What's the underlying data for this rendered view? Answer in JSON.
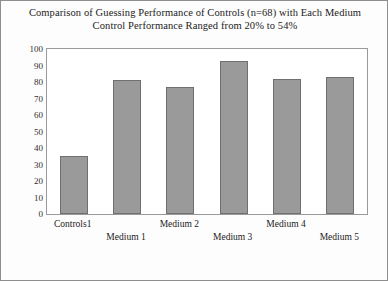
{
  "title": {
    "line1": "Comparison of Guessing Performance of Controls (n=68) with Each Medium",
    "line2": "Control Performance Ranged from 20% to 54%"
  },
  "axes": {
    "ylabel": "Percent Yes",
    "yticks": [
      "0",
      "10",
      "20",
      "30",
      "40",
      "50",
      "60",
      "70",
      "80",
      "90",
      "100"
    ],
    "xlabels": [
      "Controls1",
      "Medium 1",
      "Medium 2",
      "Medium 3",
      "Medium 4",
      "Medium 5"
    ]
  },
  "colors": {
    "bar_fill": "#9a9a9a",
    "bar_edge": "#6f6f6f",
    "frame": "#9a9a9a",
    "page_border": "#8e8e8e"
  },
  "chart_data": {
    "type": "bar",
    "title": "Comparison of Guessing Performance of Controls (n=68) with Each Medium Control Performance Ranged from 20% to 54%",
    "categories": [
      "Controls1",
      "Medium 1",
      "Medium 2",
      "Medium 3",
      "Medium 4",
      "Medium 5"
    ],
    "values": [
      35,
      81,
      77,
      93,
      82,
      83
    ],
    "xlabel": "",
    "ylabel": "Percent Yes",
    "ylim": [
      0,
      100
    ],
    "ytick_step": 10,
    "grid": false,
    "legend": false
  }
}
